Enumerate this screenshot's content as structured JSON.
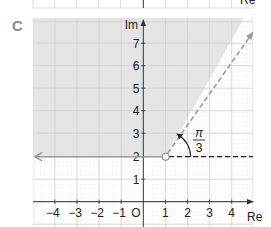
{
  "previous_figure_fragment": {
    "axis_label_fragment": "Re"
  },
  "figure": {
    "part_label": "C",
    "axes": {
      "x_label": "Re",
      "y_label": "Im",
      "origin_label": "O",
      "x_ticks": [
        "−4",
        "−3",
        "−2",
        "−1",
        "1",
        "2",
        "3",
        "4"
      ],
      "x_tick_values": [
        -4,
        -3,
        -2,
        -1,
        1,
        2,
        3,
        4
      ],
      "y_ticks": [
        "1",
        "2",
        "3",
        "4",
        "5",
        "6",
        "7"
      ],
      "y_tick_values": [
        1,
        2,
        3,
        4,
        5,
        6,
        7
      ],
      "x_range": [
        -5,
        5
      ],
      "y_range": [
        -1,
        8
      ]
    },
    "region": {
      "description": "Shaded region: Im(z) > 2 and arg(z - (1+2i)) between π/3 and π",
      "vertex": {
        "re": 1,
        "im": 2,
        "style": "open-circle"
      },
      "boundary_ray_left": {
        "direction_deg": 180,
        "style": "solid",
        "color": "#9a9a9a"
      },
      "boundary_ray_angled": {
        "direction_deg": 60,
        "style": "dashed",
        "color": "#9a9a9a"
      },
      "reference_line": {
        "direction_deg": 0,
        "style": "dashed",
        "color": "#222222"
      },
      "shade_color": "#e4e4e4"
    },
    "angle_annotation": {
      "numerator": "π",
      "denominator": "3"
    },
    "colors": {
      "grid": "#cfcfcf",
      "grid_minor": "#e9e9e9",
      "axis": "#333333",
      "text": "#222222",
      "part_label": "#8a8a8a"
    }
  }
}
